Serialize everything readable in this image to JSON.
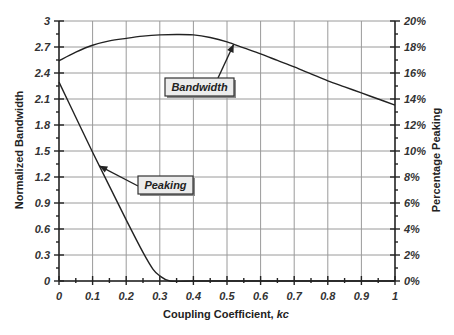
{
  "chart_data": {
    "type": "line",
    "title": "",
    "xlabel": "Coupling Coefficient, ",
    "xlabel_italic": "kc",
    "ylabel": "Normalized Bandwidth",
    "y2label": "Percentage  Peaking",
    "xlim": [
      0,
      1
    ],
    "ylim": [
      0,
      3
    ],
    "y2lim": [
      0,
      20
    ],
    "grid": true,
    "x_ticks": [
      "0",
      "0.1",
      "0.2",
      "0.3",
      "0.4",
      "0.5",
      "0.6",
      "0.7",
      "0.8",
      "0.9",
      "1"
    ],
    "y_ticks": [
      "0",
      "0.3",
      "0.6",
      "0.9",
      "1.2",
      "1.5",
      "1.8",
      "2.1",
      "2.4",
      "2.7",
      "3"
    ],
    "y2_ticks": [
      "0%",
      "2%",
      "4%",
      "6%",
      "8%",
      "10%",
      "12%",
      "14%",
      "16%",
      "18%",
      "20%"
    ],
    "series": [
      {
        "name": "Bandwidth",
        "axis": "left",
        "x": [
          0,
          0.05,
          0.1,
          0.15,
          0.2,
          0.25,
          0.3,
          0.35,
          0.4,
          0.45,
          0.5,
          0.55,
          0.6,
          0.65,
          0.7,
          0.75,
          0.8,
          0.85,
          0.9,
          0.95,
          1.0
        ],
        "values": [
          2.54,
          2.64,
          2.72,
          2.77,
          2.8,
          2.825,
          2.84,
          2.845,
          2.84,
          2.81,
          2.76,
          2.69,
          2.62,
          2.545,
          2.47,
          2.39,
          2.31,
          2.24,
          2.17,
          2.1,
          2.03
        ]
      },
      {
        "name": "Peaking",
        "axis": "right",
        "x": [
          0,
          0.05,
          0.1,
          0.15,
          0.2,
          0.25,
          0.28,
          0.3,
          0.33,
          0.4,
          0.5,
          0.6,
          0.7,
          0.8,
          0.9,
          1.0
        ],
        "values": [
          15.3,
          12.6,
          9.9,
          7.3,
          4.7,
          2.2,
          0.9,
          0.4,
          0,
          0,
          0,
          0,
          0,
          0,
          0,
          0
        ]
      }
    ],
    "annotations": [
      {
        "text": "Bandwidth",
        "points_to_x": 0.52,
        "points_to_series": "Bandwidth"
      },
      {
        "text": "Peaking",
        "points_to_x": 0.12,
        "points_to_series": "Peaking"
      }
    ]
  }
}
